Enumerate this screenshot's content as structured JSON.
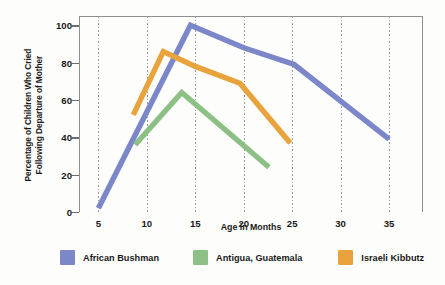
{
  "chart_data": {
    "type": "line",
    "title": "",
    "xlabel": "Age in Months",
    "ylabel": "Percentage of Children Who Cried Following Departure of Mother",
    "ylabel_lines": [
      "Percentage of Children Who Cried",
      "Following Departure of Mother"
    ],
    "xlim": [
      3,
      38.5
    ],
    "ylim": [
      0,
      105
    ],
    "xticks": [
      5,
      10,
      15,
      20,
      25,
      30,
      35
    ],
    "xtick_labels": [
      "5",
      "10",
      "15",
      "20",
      "25",
      "30",
      "35"
    ],
    "yticks": [
      0,
      20,
      40,
      60,
      80,
      100
    ],
    "ytick_labels": [
      "0",
      "20",
      "40",
      "60",
      "80",
      "100"
    ],
    "grid": "vertical-dotted",
    "legend_position": "below",
    "series": [
      {
        "name": "African Bushman",
        "color": "#7B87C9",
        "points": [
          {
            "x": 5.0,
            "y": 2
          },
          {
            "x": 14.5,
            "y": 100
          },
          {
            "x": 20.0,
            "y": 88
          },
          {
            "x": 25.2,
            "y": 79
          },
          {
            "x": 35.0,
            "y": 39
          }
        ]
      },
      {
        "name": "Antigua, Guatemala",
        "color": "#8CC085",
        "points": [
          {
            "x": 8.8,
            "y": 36
          },
          {
            "x": 13.6,
            "y": 64
          },
          {
            "x": 22.6,
            "y": 24
          }
        ]
      },
      {
        "name": "Israeli Kibbutz",
        "color": "#E8A33D",
        "points": [
          {
            "x": 8.6,
            "y": 52
          },
          {
            "x": 11.7,
            "y": 86
          },
          {
            "x": 15.0,
            "y": 78
          },
          {
            "x": 19.6,
            "y": 69
          },
          {
            "x": 24.8,
            "y": 37
          }
        ]
      }
    ]
  },
  "legend": {
    "items": [
      {
        "label": "African Bushman",
        "color": "#7B87C9"
      },
      {
        "label": "Antigua, Guatemala",
        "color": "#8CC085"
      },
      {
        "label": "Israeli Kibbutz",
        "color": "#E8A33D"
      }
    ]
  }
}
